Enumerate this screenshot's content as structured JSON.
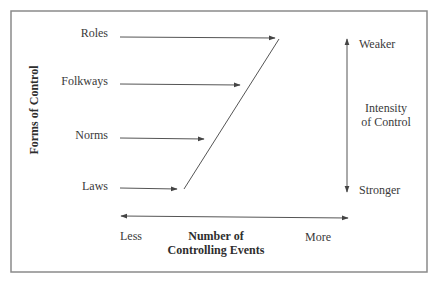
{
  "diagram": {
    "y_axis_label": "Forms of Control",
    "forms": [
      {
        "label": "Roles"
      },
      {
        "label": "Folkways"
      },
      {
        "label": "Norms"
      },
      {
        "label": "Laws"
      }
    ],
    "x_axis": {
      "title_line1": "Number of",
      "title_line2": "Controlling Events",
      "low_label": "Less",
      "high_label": "More"
    },
    "intensity_axis": {
      "title_line1": "Intensity",
      "title_line2": "of Control",
      "top_label": "Weaker",
      "bottom_label": "Stronger"
    },
    "colors": {
      "line": "#555555",
      "frame": "#8a8a8a",
      "text": "#3a3a3a"
    }
  }
}
